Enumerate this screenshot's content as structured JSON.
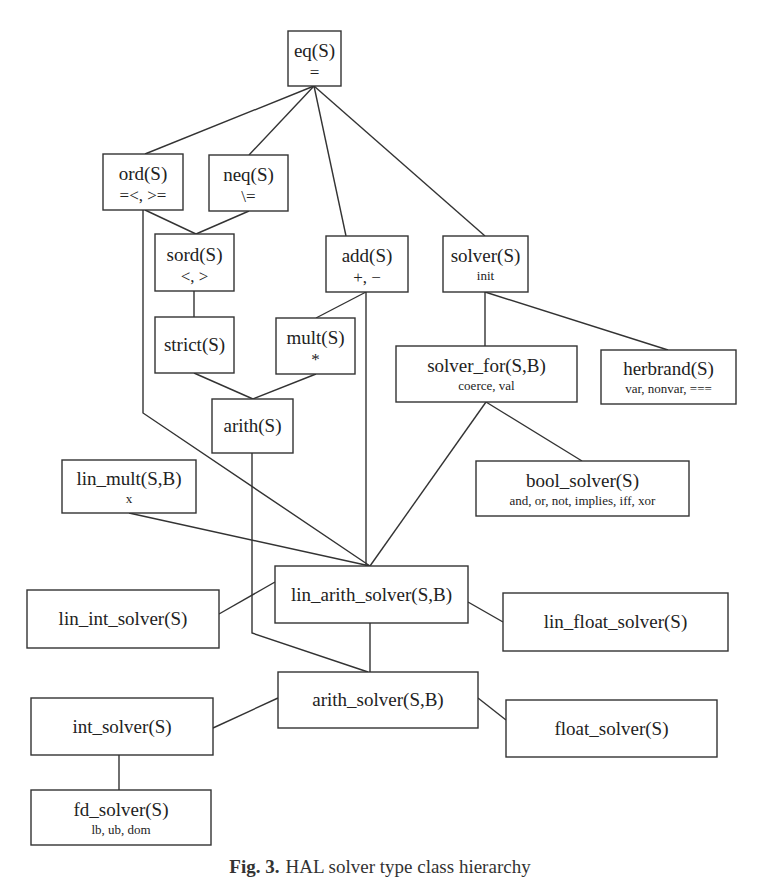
{
  "diagram": {
    "title": "HAL solver type class hierarchy",
    "nodes": [
      {
        "id": "eq",
        "name": "eq(S)",
        "ops": "="
      },
      {
        "id": "ord",
        "name": "ord(S)",
        "ops": "=<, >="
      },
      {
        "id": "neq",
        "name": "neq(S)",
        "ops": "\\="
      },
      {
        "id": "sord",
        "name": "sord(S)",
        "ops": "<, >"
      },
      {
        "id": "add",
        "name": "add(S)",
        "ops": "+, −"
      },
      {
        "id": "solver",
        "name": "solver(S)",
        "ops": "init"
      },
      {
        "id": "strict",
        "name": "strict(S)",
        "ops": ""
      },
      {
        "id": "mult",
        "name": "mult(S)",
        "ops": "*"
      },
      {
        "id": "arith",
        "name": "arith(S)",
        "ops": ""
      },
      {
        "id": "solver_for",
        "name": "solver_for(S,B)",
        "ops": "coerce, val"
      },
      {
        "id": "herbrand",
        "name": "herbrand(S)",
        "ops": "var, nonvar, ==="
      },
      {
        "id": "lin_mult",
        "name": "lin_mult(S,B)",
        "ops": "x"
      },
      {
        "id": "bool_solver",
        "name": "bool_solver(S)",
        "ops": "and, or, not, implies, iff, xor"
      },
      {
        "id": "lin_arith_solver",
        "name": "lin_arith_solver(S,B)",
        "ops": ""
      },
      {
        "id": "lin_int_solver",
        "name": "lin_int_solver(S)",
        "ops": ""
      },
      {
        "id": "lin_float_solver",
        "name": "lin_float_solver(S)",
        "ops": ""
      },
      {
        "id": "arith_solver",
        "name": "arith_solver(S,B)",
        "ops": ""
      },
      {
        "id": "int_solver",
        "name": "int_solver(S)",
        "ops": ""
      },
      {
        "id": "float_solver",
        "name": "float_solver(S)",
        "ops": ""
      },
      {
        "id": "fd_solver",
        "name": "fd_solver(S)",
        "ops": "lb, ub, dom"
      }
    ],
    "edges": [
      [
        "eq",
        "ord"
      ],
      [
        "eq",
        "neq"
      ],
      [
        "eq",
        "add"
      ],
      [
        "eq",
        "solver"
      ],
      [
        "ord",
        "sord"
      ],
      [
        "neq",
        "sord"
      ],
      [
        "ord",
        "lin_arith_solver"
      ],
      [
        "sord",
        "strict"
      ],
      [
        "add",
        "mult"
      ],
      [
        "add",
        "lin_arith_solver"
      ],
      [
        "strict",
        "arith"
      ],
      [
        "mult",
        "arith"
      ],
      [
        "solver",
        "solver_for"
      ],
      [
        "solver",
        "herbrand"
      ],
      [
        "solver_for",
        "bool_solver"
      ],
      [
        "solver_for",
        "lin_arith_solver"
      ],
      [
        "arith",
        "arith_solver"
      ],
      [
        "lin_mult",
        "lin_arith_solver"
      ],
      [
        "lin_arith_solver",
        "lin_int_solver"
      ],
      [
        "lin_arith_solver",
        "lin_float_solver"
      ],
      [
        "lin_arith_solver",
        "arith_solver"
      ],
      [
        "arith_solver",
        "int_solver"
      ],
      [
        "arith_solver",
        "float_solver"
      ],
      [
        "int_solver",
        "fd_solver"
      ]
    ]
  },
  "caption": {
    "label": "Fig. 3.",
    "text": "HAL solver type class hierarchy"
  }
}
